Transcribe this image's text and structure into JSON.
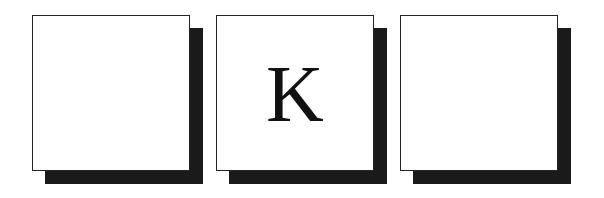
{
  "board": {
    "tiles": [
      {
        "letter": ""
      },
      {
        "letter": "K"
      },
      {
        "letter": ""
      }
    ]
  },
  "colors": {
    "tile_background": "#ffffff",
    "tile_border": "#222222",
    "shadow": "#1a1a1a",
    "letter": "#111111"
  }
}
